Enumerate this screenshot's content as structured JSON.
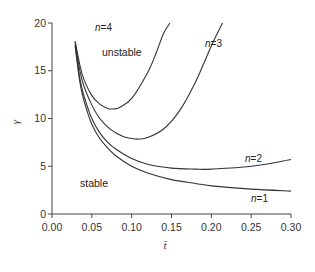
{
  "chart_data": {
    "type": "line",
    "title": "",
    "xlabel": "t̄",
    "ylabel": "γ",
    "xlim": [
      0.0,
      0.3
    ],
    "ylim": [
      0,
      20
    ],
    "grid": false,
    "legend": "none (inline curve labels)",
    "xticks": [
      "0.00",
      "0.05",
      "0.10",
      "0.15",
      "0.20",
      "0.25",
      "0.30"
    ],
    "yticks": [
      "0",
      "5",
      "10",
      "15",
      "20"
    ],
    "annotations": [
      {
        "text": "unstable",
        "x": 0.085,
        "y": 16.2
      },
      {
        "text": "stable",
        "x": 0.075,
        "y": 4.6
      }
    ],
    "series": [
      {
        "name": "n=1",
        "label": "n=1",
        "x": [
          0.029,
          0.035,
          0.04,
          0.05,
          0.06,
          0.07,
          0.08,
          0.1,
          0.12,
          0.15,
          0.18,
          0.2,
          0.25,
          0.3
        ],
        "y": [
          17.6,
          13.8,
          11.9,
          9.4,
          7.9,
          6.9,
          6.1,
          5.0,
          4.3,
          3.6,
          3.2,
          2.95,
          2.6,
          2.4
        ]
      },
      {
        "name": "n=2",
        "label": "n=2",
        "x": [
          0.029,
          0.035,
          0.04,
          0.05,
          0.06,
          0.07,
          0.08,
          0.1,
          0.12,
          0.15,
          0.18,
          0.2,
          0.25,
          0.3
        ],
        "y": [
          17.8,
          14.2,
          12.4,
          10.0,
          8.5,
          7.5,
          6.8,
          5.8,
          5.2,
          4.8,
          4.7,
          4.7,
          5.0,
          5.7
        ]
      },
      {
        "name": "n=3",
        "label": "n=3",
        "x": [
          0.029,
          0.035,
          0.04,
          0.05,
          0.06,
          0.07,
          0.08,
          0.09,
          0.1,
          0.11,
          0.12,
          0.14,
          0.16,
          0.18,
          0.2,
          0.214
        ],
        "y": [
          18.0,
          15.0,
          13.4,
          11.4,
          10.0,
          9.1,
          8.5,
          8.1,
          7.9,
          7.85,
          8.0,
          8.9,
          10.8,
          13.8,
          17.6,
          20.0
        ]
      },
      {
        "name": "n=4",
        "label": "n=4",
        "x": [
          0.029,
          0.035,
          0.04,
          0.05,
          0.06,
          0.07,
          0.077,
          0.085,
          0.1,
          0.12,
          0.13,
          0.14,
          0.148
        ],
        "y": [
          18.1,
          15.6,
          14.1,
          12.4,
          11.5,
          11.05,
          11.0,
          11.15,
          12.1,
          14.8,
          16.7,
          18.9,
          20.0
        ]
      }
    ]
  },
  "labels": {
    "unstable": "unstable",
    "stable": "stable",
    "xlabel": "t̄",
    "ylabel": "γ"
  }
}
